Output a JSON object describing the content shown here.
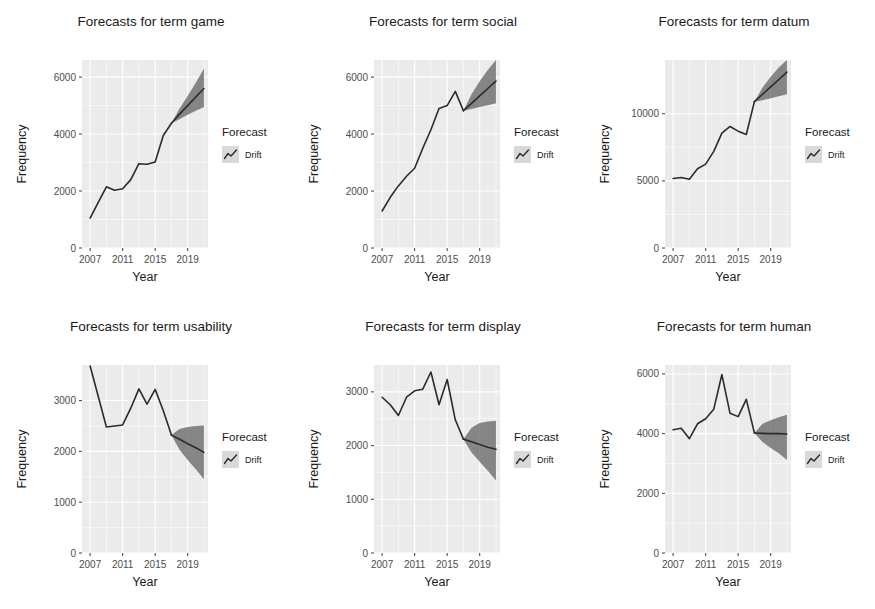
{
  "figure": {
    "background": "#ffffff",
    "panel_fill": "#ebebeb",
    "grid_color": "#ffffff",
    "line_color": "#2b2b2b",
    "ribbon_color": "#5d5d5d",
    "tick_color": "#4d4d4d",
    "rows": 2,
    "cols": 3,
    "legend_title": "Forecast",
    "legend_items": [
      "Drift"
    ],
    "legend_key_fill": "#d9d9d9",
    "legend_icon": "line-chart-icon",
    "xlabel": "Year",
    "ylabel": "Frequency",
    "x_ticks": [
      "2007",
      "2011",
      "2015",
      "2019"
    ],
    "x_tick_values": [
      2007,
      2011,
      2015,
      2019
    ],
    "xlim": [
      2006,
      2021.5
    ]
  },
  "chart_data": [
    {
      "type": "line",
      "title": "Forecasts for term game",
      "term": "game",
      "xlabel": "Year",
      "ylabel": "Frequency",
      "ylim": [
        0,
        6600
      ],
      "y_ticks": [
        0,
        2000,
        4000,
        6000
      ],
      "y_tick_labels": [
        "0",
        "2000",
        "4000",
        "6000"
      ],
      "grid": true,
      "legend_position": "right",
      "series": [
        {
          "name": "Observed",
          "x": [
            2007,
            2008,
            2009,
            2010,
            2011,
            2012,
            2013,
            2014,
            2015,
            2016,
            2017
          ],
          "values": [
            1050,
            1600,
            2150,
            2030,
            2080,
            2400,
            2960,
            2940,
            3020,
            3950,
            4380
          ]
        },
        {
          "name": "Drift",
          "x": [
            2017,
            2018,
            2019,
            2020,
            2021
          ],
          "values": [
            4380,
            4700,
            5000,
            5300,
            5600
          ],
          "lower": [
            4380,
            4520,
            4680,
            4820,
            4950
          ],
          "upper": [
            4380,
            4900,
            5340,
            5800,
            6300
          ]
        }
      ]
    },
    {
      "type": "line",
      "title": "Forecasts for term social",
      "term": "social",
      "xlabel": "Year",
      "ylabel": "Frequency",
      "ylim": [
        0,
        6600
      ],
      "y_ticks": [
        0,
        2000,
        4000,
        6000
      ],
      "y_tick_labels": [
        "0",
        "2000",
        "4000",
        "6000"
      ],
      "grid": true,
      "legend_position": "right",
      "series": [
        {
          "name": "Observed",
          "x": [
            2007,
            2008,
            2009,
            2010,
            2011,
            2012,
            2013,
            2014,
            2015,
            2016,
            2017
          ],
          "values": [
            1300,
            1780,
            2180,
            2520,
            2800,
            3500,
            4150,
            4900,
            5000,
            5500,
            4820
          ]
        },
        {
          "name": "Drift",
          "x": [
            2017,
            2018,
            2019,
            2020,
            2021
          ],
          "values": [
            4820,
            5080,
            5340,
            5600,
            5860
          ],
          "lower": [
            4820,
            4880,
            4950,
            5010,
            5080
          ],
          "upper": [
            4820,
            5400,
            5850,
            6250,
            6600
          ]
        }
      ]
    },
    {
      "type": "line",
      "title": "Forecasts for term datum",
      "term": "datum",
      "xlabel": "Year",
      "ylabel": "Frequency",
      "ylim": [
        0,
        14000
      ],
      "y_ticks": [
        0,
        5000,
        10000
      ],
      "y_tick_labels": [
        "0",
        "5000",
        "10000"
      ],
      "grid": true,
      "legend_position": "right",
      "series": [
        {
          "name": "Observed",
          "x": [
            2007,
            2008,
            2009,
            2010,
            2011,
            2012,
            2013,
            2014,
            2015,
            2016,
            2017
          ],
          "values": [
            5180,
            5250,
            5120,
            5900,
            6250,
            7200,
            8550,
            9050,
            8700,
            8450,
            10900
          ]
        },
        {
          "name": "Drift",
          "x": [
            2017,
            2018,
            2019,
            2020,
            2021
          ],
          "values": [
            10900,
            11450,
            12000,
            12550,
            13100
          ],
          "lower": [
            10900,
            11000,
            11150,
            11300,
            11450
          ],
          "upper": [
            10900,
            11950,
            12750,
            13450,
            14000
          ]
        }
      ]
    },
    {
      "type": "line",
      "title": "Forecasts for term usability",
      "term": "usability",
      "xlabel": "Year",
      "ylabel": "Frequency",
      "ylim": [
        0,
        3700
      ],
      "y_ticks": [
        0,
        1000,
        2000,
        3000
      ],
      "y_tick_labels": [
        "0",
        "1000",
        "2000",
        "3000"
      ],
      "grid": true,
      "legend_position": "right",
      "series": [
        {
          "name": "Observed",
          "x": [
            2007,
            2008,
            2009,
            2010,
            2011,
            2012,
            2013,
            2014,
            2015,
            2016,
            2017
          ],
          "values": [
            3680,
            3080,
            2480,
            2500,
            2520,
            2850,
            3230,
            2930,
            3220,
            2800,
            2320
          ]
        },
        {
          "name": "Drift",
          "x": [
            2017,
            2018,
            2019,
            2020,
            2021
          ],
          "values": [
            2320,
            2240,
            2150,
            2070,
            1980
          ],
          "lower": [
            2320,
            2030,
            1830,
            1650,
            1450
          ],
          "upper": [
            2320,
            2440,
            2480,
            2500,
            2510
          ]
        }
      ]
    },
    {
      "type": "line",
      "title": "Forecasts for term display",
      "term": "display",
      "xlabel": "Year",
      "ylabel": "Frequency",
      "ylim": [
        0,
        3500
      ],
      "y_ticks": [
        0,
        1000,
        2000,
        3000
      ],
      "y_tick_labels": [
        "0",
        "1000",
        "2000",
        "3000"
      ],
      "grid": true,
      "legend_position": "right",
      "series": [
        {
          "name": "Observed",
          "x": [
            2007,
            2008,
            2009,
            2010,
            2011,
            2012,
            2013,
            2014,
            2015,
            2016,
            2017
          ],
          "values": [
            2900,
            2760,
            2560,
            2900,
            3020,
            3050,
            3370,
            2760,
            3230,
            2480,
            2120
          ]
        },
        {
          "name": "Drift",
          "x": [
            2017,
            2018,
            2019,
            2020,
            2021
          ],
          "values": [
            2120,
            2070,
            2020,
            1970,
            1930
          ],
          "lower": [
            2120,
            1870,
            1700,
            1530,
            1350
          ],
          "upper": [
            2120,
            2330,
            2420,
            2450,
            2460
          ]
        }
      ]
    },
    {
      "type": "line",
      "title": "Forecasts for term human",
      "term": "human",
      "xlabel": "Year",
      "ylabel": "Frequency",
      "ylim": [
        0,
        6300
      ],
      "y_ticks": [
        0,
        2000,
        4000,
        6000
      ],
      "y_tick_labels": [
        "0",
        "2000",
        "4000",
        "6000"
      ],
      "grid": true,
      "legend_position": "right",
      "series": [
        {
          "name": "Observed",
          "x": [
            2007,
            2008,
            2009,
            2010,
            2011,
            2012,
            2013,
            2014,
            2015,
            2016,
            2017
          ],
          "values": [
            4130,
            4180,
            3830,
            4330,
            4500,
            4820,
            5980,
            4680,
            4570,
            5150,
            4020
          ]
        },
        {
          "name": "Drift",
          "x": [
            2017,
            2018,
            2019,
            2020,
            2021
          ],
          "values": [
            4020,
            4010,
            4000,
            4000,
            3990
          ],
          "lower": [
            4020,
            3720,
            3520,
            3340,
            3120
          ],
          "upper": [
            4020,
            4330,
            4450,
            4550,
            4630
          ]
        }
      ]
    }
  ]
}
